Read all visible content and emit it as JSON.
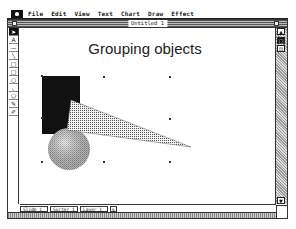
{
  "menubar": {
    "apple_icon": "apple-menu-icon",
    "items": [
      "File",
      "Edit",
      "View",
      "Text",
      "Chart",
      "Draw",
      "Effect"
    ]
  },
  "window": {
    "title": "Untitled 1"
  },
  "toolbox": {
    "tools": [
      {
        "name": "pointer",
        "glyph": "➤",
        "selected": true
      },
      {
        "name": "text",
        "glyph": "A",
        "selected": false
      },
      {
        "name": "line-horizontal",
        "glyph": "—",
        "selected": false
      },
      {
        "name": "line-diagonal",
        "glyph": "╲",
        "selected": false
      },
      {
        "name": "rectangle",
        "glyph": "□",
        "selected": false
      },
      {
        "name": "rounded-rectangle",
        "glyph": "▢",
        "selected": false
      },
      {
        "name": "oval",
        "glyph": "○",
        "selected": false
      },
      {
        "name": "arc",
        "glyph": "◟",
        "selected": false
      },
      {
        "name": "polygon",
        "glyph": "⬠",
        "selected": false
      },
      {
        "name": "freehand",
        "glyph": "✎",
        "selected": false
      },
      {
        "name": "eyedropper",
        "glyph": "✐",
        "selected": false
      }
    ]
  },
  "slide": {
    "title": "Grouping objects",
    "shapes": {
      "rectangle_fill": "#111111",
      "circle_fill": "#b8b8b8",
      "triangle_pattern": "dotted"
    }
  },
  "right_scroll": {
    "buttons": [
      "▲",
      "□",
      "⊡",
      "▼"
    ]
  },
  "status": {
    "fields": [
      "Slide 1",
      "Sorter 1",
      "Layer 1"
    ],
    "extra": "⇅"
  }
}
